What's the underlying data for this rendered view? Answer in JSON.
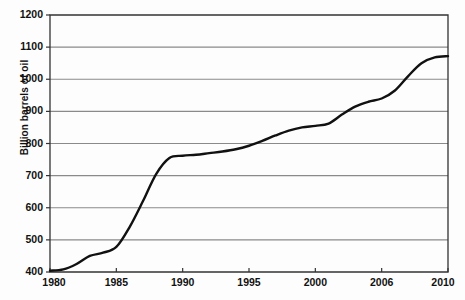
{
  "chart_data": {
    "type": "line",
    "title": "",
    "xlabel": "",
    "ylabel": "Billion barrels of oil",
    "xlim": [
      1980,
      2010
    ],
    "ylim": [
      400,
      1200
    ],
    "grid": true,
    "legend": "none",
    "series_name": "Cumulative proved oil reserves",
    "line_color": "#111111",
    "grid_color": "#8a8a8a",
    "axis_color": "#333333",
    "background_color": "#ffffff",
    "xticks": [
      {
        "value": 1980,
        "label": "1980"
      },
      {
        "value": 1985,
        "label": "1985"
      },
      {
        "value": 1990,
        "label": "1990"
      },
      {
        "value": 1995,
        "label": "1995"
      },
      {
        "value": 2000,
        "label": "2000"
      },
      {
        "value": 2005,
        "label": "2006"
      },
      {
        "value": 2010,
        "label": "2010"
      }
    ],
    "yticks": [
      {
        "value": 400,
        "label": "400"
      },
      {
        "value": 500,
        "label": "500"
      },
      {
        "value": 600,
        "label": "600"
      },
      {
        "value": 700,
        "label": "700"
      },
      {
        "value": 800,
        "label": "800"
      },
      {
        "value": 900,
        "label": "900"
      },
      {
        "value": 1000,
        "label": "1000"
      },
      {
        "value": 1100,
        "label": "1100"
      },
      {
        "value": 1200,
        "label": "1200"
      }
    ],
    "x": [
      1980,
      1981,
      1982,
      1983,
      1984,
      1985,
      1986,
      1987,
      1988,
      1989,
      1990,
      1991,
      1992,
      1993,
      1994,
      1995,
      1996,
      1997,
      1998,
      1999,
      2000,
      2001,
      2002,
      2003,
      2004,
      2005,
      2006,
      2007,
      2008,
      2009,
      2010
    ],
    "values": [
      404,
      408,
      425,
      450,
      460,
      478,
      540,
      620,
      705,
      755,
      762,
      765,
      770,
      775,
      782,
      793,
      808,
      825,
      840,
      850,
      855,
      862,
      890,
      915,
      930,
      940,
      965,
      1010,
      1050,
      1068,
      1072
    ]
  }
}
